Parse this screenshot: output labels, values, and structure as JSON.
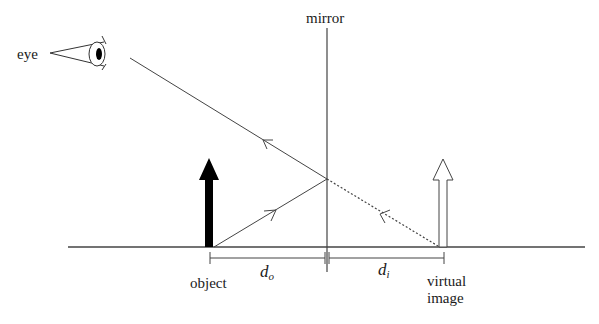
{
  "labels": {
    "eye": "eye",
    "mirror": "mirror",
    "object": "object",
    "virtual_image_line1": "virtual",
    "virtual_image_line2": "image",
    "d_o_main": "d",
    "d_o_sub": "o",
    "d_i_main": "d",
    "d_i_sub": "i"
  },
  "colors": {
    "line": "#444444",
    "object_arrow": "#000000",
    "image_arrow_fill": "#ffffff",
    "text": "#1a1a1a"
  },
  "geometry": {
    "baseline_y": 247,
    "mirror_x": 327,
    "object_x": 209,
    "image_x": 443,
    "reflection_point": [
      327,
      179
    ],
    "eye_ray_start": [
      130,
      58
    ]
  }
}
